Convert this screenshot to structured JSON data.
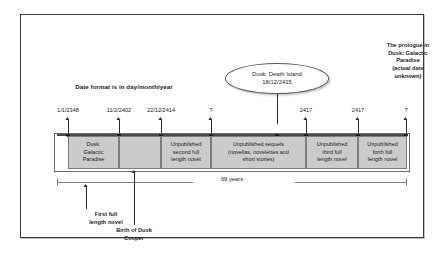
{
  "diagram": {
    "title_note": "Date format is in day/month/year",
    "span_label": "69 years",
    "callout": {
      "line1": "Dusk: Death Island",
      "line2": "18/12/2415"
    },
    "prologue_note": "The prologue in\nDusk: Galactic\nParadise\n(actual date\nunknown)",
    "bottom_notes": [
      {
        "label": "First full\nlength novel"
      },
      {
        "label": "Birth of Dusk\nCooper"
      }
    ],
    "tick_labels": [
      {
        "value": "1/1/2348"
      },
      {
        "value": "11/2/2402"
      },
      {
        "value": "22/12/2414"
      },
      {
        "value": "?"
      },
      {
        "value": "2417"
      },
      {
        "value": "2417"
      },
      {
        "value": "?"
      }
    ],
    "segments": [
      {
        "label": "Dusk:\nGalactic\nParadise"
      },
      {
        "label": ""
      },
      {
        "label": "Unpublished\nsecond full\nlength novel"
      },
      {
        "label": "Unpublished sequels\n(novellas, novelettes and\nshort stories)"
      },
      {
        "label": "Unpublished\nthird full\nlength novel"
      },
      {
        "label": "Unpublished\nforth full\nlength novel"
      }
    ],
    "colors": {
      "segment_fill": "#cbcbcb",
      "segment_border": "#7d7d7d",
      "axis": "#4a4a4a",
      "frame": "#3b3b3b",
      "text": "#231f20",
      "callout_ring": "#5a5a5a"
    }
  }
}
